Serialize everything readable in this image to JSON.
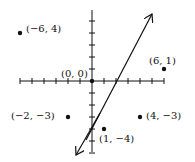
{
  "diagram": {
    "type": "coordinate-plane",
    "origin_px": [
      92,
      81
    ],
    "unit_px": 12,
    "x_ticks": [
      -6,
      -5,
      -4,
      -3,
      -2,
      -1,
      1,
      2,
      3,
      4,
      5,
      6
    ],
    "y_ticks": [
      5,
      4,
      3,
      2,
      1,
      -1,
      -2,
      -3,
      -4,
      -5,
      -6
    ],
    "points": [
      {
        "x": -6,
        "y": 4,
        "label": "(−6, 4)"
      },
      {
        "x": 6,
        "y": 1,
        "label": "(6, 1)"
      },
      {
        "x": 0,
        "y": 0,
        "label": "(0, 0)"
      },
      {
        "x": -2,
        "y": -3,
        "label": "(−2, −3)"
      },
      {
        "x": 4,
        "y": -3,
        "label": "(4, −3)"
      },
      {
        "x": 1,
        "y": -4,
        "label": "(1, −4)"
      }
    ],
    "line": {
      "equation": "y = 2x − 4",
      "from": [
        -0.5,
        -6.2
      ],
      "to": [
        5.1,
        5.6
      ]
    },
    "colors": {
      "ink": "#111111",
      "background": "#ffffff"
    }
  }
}
